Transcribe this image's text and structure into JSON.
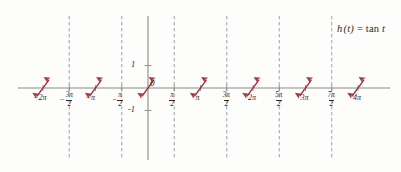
{
  "figure": {
    "background_color": "#fdfdfb",
    "curve_color": "#9e2a35",
    "axis_color": "#8a8a8a",
    "asymptote_color": "#8d9aa8",
    "text_color": "#2b2b2b"
  },
  "function_label": {
    "name": "h (t) = tan t",
    "h": "h",
    "arg": "(t)",
    "equals": "=",
    "tan": "tan",
    "var": "t"
  },
  "axes": {
    "x_axis_name": "t",
    "y_axis_name": "h(t)",
    "origin_label": "0",
    "y_ticks": [
      {
        "value": 1,
        "label": "1",
        "y_px": 65
      },
      {
        "value": -1,
        "label": "-1",
        "y_px": 110
      }
    ],
    "x_ticks": [
      {
        "value": -6.2832,
        "label": "−2π",
        "kind": "whole",
        "sign": "−",
        "main": "2π",
        "x_px": 39
      },
      {
        "value": -4.7124,
        "label": "−3π/2",
        "kind": "fraction",
        "sign": "−",
        "num": "3π",
        "den": "2",
        "x_px": 65
      },
      {
        "value": -3.1416,
        "label": "−π",
        "kind": "whole",
        "sign": "−",
        "main": "π",
        "x_px": 91
      },
      {
        "value": -1.5708,
        "label": "−π/2",
        "kind": "fraction",
        "sign": "−",
        "num": "π",
        "den": "2",
        "x_px": 118
      },
      {
        "value": 1.5708,
        "label": "π/2",
        "kind": "fraction",
        "sign": "",
        "num": "π",
        "den": "2",
        "x_px": 172
      },
      {
        "value": 3.1416,
        "label": "π",
        "kind": "whole",
        "sign": "",
        "main": "π",
        "x_px": 196
      },
      {
        "value": 4.7124,
        "label": "3π/2",
        "kind": "fraction",
        "sign": "",
        "num": "3π",
        "den": "2",
        "x_px": 222
      },
      {
        "value": 6.2832,
        "label": "2π",
        "kind": "whole",
        "sign": "",
        "main": "2π",
        "x_px": 248
      },
      {
        "value": 7.854,
        "label": "5π/2",
        "kind": "fraction",
        "sign": "",
        "num": "5π",
        "den": "2",
        "x_px": 275
      },
      {
        "value": 9.4248,
        "label": "3π",
        "kind": "whole",
        "sign": "",
        "main": "3π",
        "x_px": 301
      },
      {
        "value": 10.9956,
        "label": "7π/2",
        "kind": "fraction",
        "sign": "",
        "num": "7π",
        "den": "2",
        "x_px": 328
      },
      {
        "value": 12.5664,
        "label": "4π",
        "kind": "whole",
        "sign": "",
        "main": "4π",
        "x_px": 354
      }
    ]
  },
  "chart_data": {
    "type": "line",
    "title": "",
    "subtitle": "",
    "xlabel": "t",
    "ylabel": "h(t)",
    "grid": false,
    "legend": "none",
    "annotations": [
      "h (t) = tan t"
    ],
    "xlim": [
      -7.4,
      13.6
    ],
    "ylim": [
      -3.1,
      3.1
    ],
    "x_tick_values": [
      -6.2832,
      -4.7124,
      -3.1416,
      -1.5708,
      0,
      1.5708,
      3.1416,
      4.7124,
      6.2832,
      7.854,
      9.4248,
      10.9956,
      12.5664
    ],
    "x_tick_labels": [
      "-2π",
      "-3π/2",
      "-π",
      "-π/2",
      "0",
      "π/2",
      "π",
      "3π/2",
      "2π",
      "5π/2",
      "3π",
      "7π/2",
      "4π"
    ],
    "y_tick_values": [
      -1,
      1
    ],
    "y_tick_labels": [
      "-1",
      "1"
    ],
    "series": [
      {
        "name": "h(t) = tan t",
        "color": "#9e2a35",
        "period": 3.14159,
        "asymptotes": [
          -4.7124,
          -1.5708,
          1.5708,
          4.7124,
          7.854,
          10.9956
        ],
        "zero_crossings": [
          -6.2832,
          -3.1416,
          0,
          3.1416,
          6.2832,
          9.4248,
          12.5664
        ],
        "branches": [
          {
            "zero": -6.2832,
            "left_asymptote": -7.854,
            "right_asymptote": -4.7124
          },
          {
            "zero": -3.1416,
            "left_asymptote": -4.7124,
            "right_asymptote": -1.5708
          },
          {
            "zero": 0.0,
            "left_asymptote": -1.5708,
            "right_asymptote": 1.5708
          },
          {
            "zero": 3.1416,
            "left_asymptote": 1.5708,
            "right_asymptote": 4.7124
          },
          {
            "zero": 6.2832,
            "left_asymptote": 4.7124,
            "right_asymptote": 7.854
          },
          {
            "zero": 9.4248,
            "left_asymptote": 7.854,
            "right_asymptote": 10.9956
          },
          {
            "zero": 12.5664,
            "left_asymptote": 10.9956,
            "right_asymptote": 14.1372
          }
        ]
      }
    ]
  }
}
